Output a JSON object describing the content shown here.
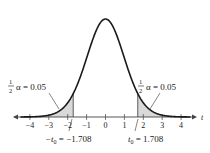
{
  "chart_data": {
    "type": "area",
    "title": "",
    "xlabel": "t",
    "ylabel": "",
    "xlim": [
      -4.5,
      4.5
    ],
    "x_ticks": [
      -4,
      -3,
      -2,
      -1,
      0,
      1,
      2,
      3,
      4
    ],
    "x_tick_labels": [
      "−4",
      "−3",
      "−2",
      "−1",
      "0",
      "1",
      "2",
      "3",
      "4"
    ],
    "grid": false,
    "legend": null,
    "series": [
      {
        "name": "t-distribution density",
        "type": "line"
      }
    ],
    "shaded_regions": [
      {
        "from": -4.5,
        "to": -1.708,
        "area": 0.05
      },
      {
        "from": 1.708,
        "to": 4.5,
        "area": 0.05
      }
    ],
    "critical_values": [
      -1.708,
      1.708
    ],
    "annotations": [
      {
        "text_frac": "1/2",
        "text": "α = 0.05",
        "target": "left tail"
      },
      {
        "text_frac": "1/2",
        "text": "α = 0.05",
        "target": "right tail"
      },
      {
        "text": "−t0 = −1.708",
        "target": "-1.708"
      },
      {
        "text": "t0 = 1.708",
        "target": "1.708"
      }
    ]
  },
  "labels": {
    "axis_var": "t",
    "left_frac_num": "1",
    "left_frac_den": "2",
    "left_alpha": "α = 0.05",
    "right_frac_num": "1",
    "right_frac_den": "2",
    "right_alpha": "α = 0.05",
    "left_crit_prefix": "−t",
    "left_crit_sub": "0",
    "left_crit_value": " = −1.708",
    "right_crit_prefix": "t",
    "right_crit_sub": "0",
    "right_crit_value": " = 1.708",
    "ticks": [
      "−4",
      "−3",
      "−2",
      "−1",
      "0",
      "1",
      "2",
      "3",
      "4"
    ]
  },
  "colors": {
    "curve": "#1a1a1a",
    "shade": "#d9d9d9",
    "axis": "#444444",
    "text": "#222222"
  }
}
